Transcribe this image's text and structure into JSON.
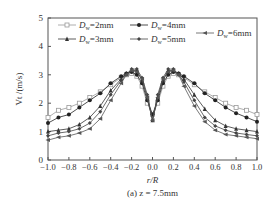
{
  "chart_data": {
    "type": "line",
    "title": "",
    "caption": "(a) z = 7.5mm",
    "xlabel": "r/R",
    "ylabel": "V_t /(m/s)",
    "xlim": [
      -1.0,
      1.0
    ],
    "ylim": [
      0,
      5
    ],
    "xticks": [
      "-1.0",
      "-0.8",
      "-0.6",
      "-0.4",
      "-0.2",
      "0.0",
      "0.2",
      "0.4",
      "0.6",
      "0.8",
      "1.0"
    ],
    "yticks": [
      "0",
      "1",
      "2",
      "3",
      "4",
      "5"
    ],
    "grid": false,
    "legend_position": "top",
    "x": [
      -1.0,
      -0.9,
      -0.8,
      -0.7,
      -0.6,
      -0.5,
      -0.4,
      -0.3,
      -0.25,
      -0.2,
      -0.15,
      -0.1,
      -0.05,
      0.0,
      0.05,
      0.1,
      0.15,
      0.2,
      0.25,
      0.3,
      0.4,
      0.5,
      0.6,
      0.7,
      0.8,
      0.9,
      1.0
    ],
    "series": [
      {
        "name": "D_w=2mm",
        "color": "#999999",
        "marker": "square-open",
        "values": [
          1.5,
          1.75,
          1.85,
          2.0,
          2.2,
          2.4,
          2.65,
          2.9,
          3.0,
          3.05,
          2.95,
          2.6,
          2.0,
          1.6,
          2.0,
          2.6,
          2.95,
          3.05,
          3.0,
          2.9,
          2.65,
          2.4,
          2.2,
          2.0,
          1.85,
          1.75,
          1.6
        ]
      },
      {
        "name": "D_w=3mm",
        "color": "#222222",
        "marker": "circle",
        "values": [
          1.3,
          1.5,
          1.6,
          1.85,
          2.1,
          2.35,
          2.7,
          2.95,
          3.05,
          3.1,
          3.0,
          2.7,
          2.1,
          1.6,
          2.1,
          2.7,
          3.0,
          3.1,
          3.05,
          2.95,
          2.7,
          2.35,
          2.1,
          1.85,
          1.65,
          1.5,
          1.35
        ]
      },
      {
        "name": "D_w=4mm",
        "color": "#333333",
        "marker": "triangle",
        "values": [
          1.0,
          1.05,
          1.1,
          1.25,
          1.5,
          1.9,
          2.45,
          2.85,
          3.05,
          3.15,
          3.15,
          2.8,
          2.2,
          1.4,
          2.2,
          2.8,
          3.15,
          3.15,
          3.05,
          2.85,
          2.3,
          1.8,
          1.4,
          1.2,
          1.1,
          1.05,
          1.0
        ]
      },
      {
        "name": "D_w=5mm",
        "color": "#444444",
        "marker": "diamond",
        "values": [
          0.85,
          0.95,
          1.0,
          1.1,
          1.3,
          1.7,
          2.3,
          2.8,
          3.0,
          3.2,
          3.2,
          2.9,
          2.3,
          1.4,
          2.3,
          2.9,
          3.2,
          3.2,
          3.0,
          2.75,
          2.1,
          1.5,
          1.2,
          1.05,
          0.95,
          0.9,
          0.85
        ]
      },
      {
        "name": "D_w=6mm",
        "color": "#555555",
        "marker": "triangle-left",
        "values": [
          0.7,
          0.8,
          0.85,
          0.95,
          1.1,
          1.45,
          2.1,
          2.7,
          3.0,
          3.15,
          3.1,
          2.85,
          2.2,
          1.4,
          2.2,
          2.85,
          3.1,
          3.15,
          3.0,
          2.6,
          1.9,
          1.35,
          1.05,
          0.9,
          0.85,
          0.8,
          0.75
        ]
      }
    ]
  },
  "legend": [
    {
      "label": "D",
      "sub": "w",
      "rest": "=2mm"
    },
    {
      "label": "D",
      "sub": "w",
      "rest": "=4mm"
    },
    {
      "label": "D",
      "sub": "w",
      "rest": "=3mm"
    },
    {
      "label": "D",
      "sub": "w",
      "rest": "=5mm"
    },
    {
      "label": "D",
      "sub": "w",
      "rest": "=6mm"
    }
  ]
}
